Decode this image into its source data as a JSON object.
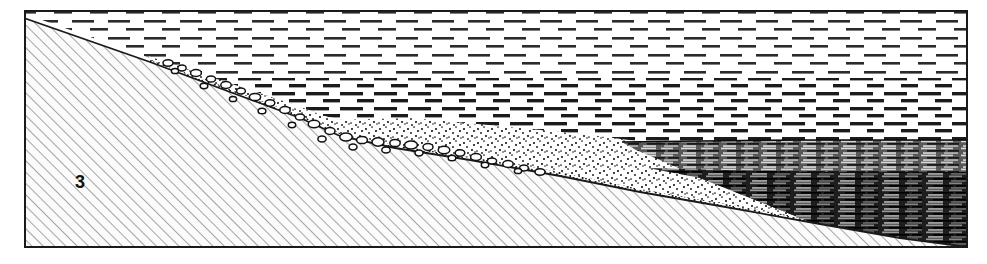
{
  "figure": {
    "frame": {
      "left": 24,
      "top": 10,
      "right": 968,
      "bottom": 248,
      "stroke_color": "#1a1a1a",
      "stroke_width": 2,
      "fill_color": "#ffffff"
    },
    "background_color": "#ffffff"
  },
  "units": [
    {
      "id": "basement",
      "label": "3",
      "label_x": 80,
      "label_y": 188,
      "pattern": "diagonal-hatch",
      "pattern_color": "#8e8e8e",
      "fill_color": "#fbfbfb",
      "hatch_spacing": 8,
      "hatch_angle_deg": 45
    },
    {
      "id": "conglomerate",
      "label": "",
      "pattern": "cobble-clasts",
      "pattern_color": "#111111",
      "fill_color": "#ffffff"
    },
    {
      "id": "sand",
      "label": "",
      "pattern": "stipple",
      "pattern_color": "#141414",
      "fill_color": "#ffffff"
    },
    {
      "id": "silt-clay",
      "label": "",
      "pattern": "horizontal-dashes",
      "pattern_color": "#2b2b2b",
      "fill_color": "#ffffff",
      "dash_length": 22,
      "dash_gap": 14,
      "row_spacing": 17
    },
    {
      "id": "laminated-mud",
      "label": "",
      "pattern": "dark-lamination",
      "pattern_color": "#101010",
      "fill_color": "#4a4a4a"
    }
  ],
  "geometry": {
    "basement_top": "M24,18 L150,62 L230,92 L300,118 L340,136 L395,148 L470,160 L560,176 L640,192 L720,206 L820,224 L900,238 L968,247",
    "basement_path": "M24,18 L150,62 L230,92 L300,118 L340,136 L395,148 L470,160 L560,176 L640,192 L720,206 L820,224 L900,238 L968,247 L968,247 L24,247 Z",
    "conglomerate_path": "M150,58 L230,86 L300,111 L338,128 L370,133 L420,136 L470,145 L520,152 L560,162 L560,176 L470,160 L395,148 L340,136 L300,118 L230,92 L150,62 Z",
    "sand_path": "M148,56 L226,82 L298,106 L336,120 L410,118 L500,126 L590,135 L680,146 L760,168 L830,196 L880,218 L900,232 L820,224 L720,206 L640,192 L560,176 L470,160 L395,148 L340,136 L300,118 L230,92 L150,62 Z",
    "laminated_path": "M622,142 L968,140 L968,247 L900,238 L820,224 L760,200 L700,176 L660,158 Z",
    "laminated_top": "M622,142 L700,141 L800,140 L900,140 L968,140"
  },
  "stipple_seed": 20240517,
  "annotations": []
}
